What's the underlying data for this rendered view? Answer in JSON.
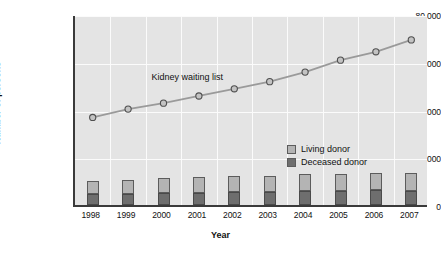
{
  "chart_data": {
    "type": "bar",
    "title": "",
    "xlabel": "Year",
    "ylabel": "Number of persons",
    "categories": [
      "1998",
      "1999",
      "2000",
      "2001",
      "2002",
      "2003",
      "2004",
      "2005",
      "2006",
      "2007"
    ],
    "ylim": [
      0,
      80000
    ],
    "yticks": [
      "0",
      "20,000",
      "40,000",
      "60,000",
      "80,000"
    ],
    "ytick_values": [
      0,
      20000,
      40000,
      60000,
      80000
    ],
    "grid": true,
    "legend_position": "inside-center-right",
    "annotations": [
      {
        "text": "Kidney waiting list",
        "x": "2000",
        "y": 54000
      }
    ],
    "series": [
      {
        "name": "Kidney waiting list",
        "type": "line",
        "values": [
          37500,
          41000,
          43500,
          46500,
          49500,
          52500,
          56500,
          61500,
          65000,
          70000
        ]
      },
      {
        "name": "Deceased donor",
        "type": "bar-stack",
        "color": "#6e6e6e",
        "values": [
          4700,
          4800,
          4900,
          5100,
          5300,
          5400,
          5800,
          6000,
          6200,
          6000
        ]
      },
      {
        "name": "Living donor",
        "type": "bar-stack",
        "color": "#b4b4b4",
        "values": [
          5500,
          5700,
          6500,
          6800,
          6700,
          6800,
          7000,
          7000,
          7400,
          7400
        ]
      }
    ]
  },
  "legend": {
    "items": [
      {
        "label": "Living donor",
        "color": "#b4b4b4"
      },
      {
        "label": "Deceased donor",
        "color": "#6e6e6e"
      }
    ]
  }
}
